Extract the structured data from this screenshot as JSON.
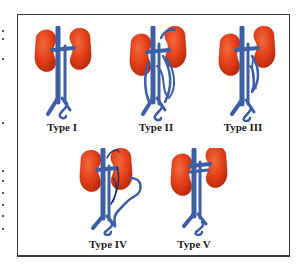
{
  "figure": {
    "panels": [
      {
        "id": "type-1",
        "label": "Type I"
      },
      {
        "id": "type-2",
        "label": "Type II"
      },
      {
        "id": "type-3",
        "label": "Type III"
      },
      {
        "id": "type-4",
        "label": "Type IV"
      },
      {
        "id": "type-5",
        "label": "Type V"
      }
    ],
    "colors": {
      "kidney": "#e23d17",
      "kidney_shade": "#b92a0c",
      "vessel": "#3d5fa6",
      "vessel_dark": "#1f2f6a",
      "border": "#3a3a3a"
    }
  }
}
